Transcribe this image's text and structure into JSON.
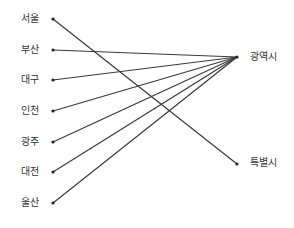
{
  "left_items": [
    {
      "label": "서울",
      "y": 19
    },
    {
      "label": "부산",
      "y": 50
    },
    {
      "label": "대구",
      "y": 80
    },
    {
      "label": "인천",
      "y": 111
    },
    {
      "label": "광주",
      "y": 142
    },
    {
      "label": "대전",
      "y": 172
    },
    {
      "label": "울산",
      "y": 203
    }
  ],
  "right_items": [
    {
      "label": "광역시",
      "y": 57
    },
    {
      "label": "특별시",
      "y": 164
    }
  ],
  "connections": [
    {
      "from": "서울",
      "to": "특별시"
    },
    {
      "from": "부산",
      "to": "광역시"
    },
    {
      "from": "대구",
      "to": "광역시"
    },
    {
      "from": "인천",
      "to": "광역시"
    },
    {
      "from": "광주",
      "to": "광역시"
    },
    {
      "from": "대전",
      "to": "광역시"
    },
    {
      "from": "울산",
      "to": "광역시"
    }
  ],
  "line_color": "#3a3a3a"
}
